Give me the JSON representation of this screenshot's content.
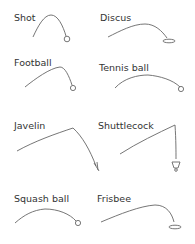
{
  "panels": [
    {
      "id": "shot",
      "label": "Shot",
      "end_marker": "circle"
    },
    {
      "id": "discus",
      "label": "Discus",
      "end_marker": "ellipse"
    },
    {
      "id": "football",
      "label": "Football",
      "end_marker": "circle"
    },
    {
      "id": "tennis-ball",
      "label": "Tennis ball",
      "end_marker": "circle"
    },
    {
      "id": "javelin",
      "label": "Javelin",
      "end_marker": "javelin-tip"
    },
    {
      "id": "shuttlecock",
      "label": "Shuttlecock",
      "end_marker": "shuttlecock"
    },
    {
      "id": "squash-ball",
      "label": "Squash ball",
      "end_marker": "circle"
    },
    {
      "id": "frisbee",
      "label": "Frisbee",
      "end_marker": "ellipse"
    }
  ],
  "colors": {
    "line": "#666666",
    "text": "#333333",
    "background": "#ffffff"
  }
}
